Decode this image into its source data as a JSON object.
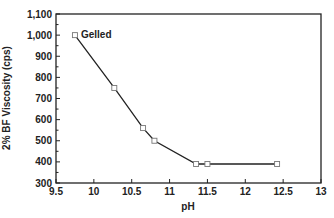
{
  "chart_data": {
    "type": "line",
    "title": "",
    "xlabel": "pH",
    "ylabel": "2% BF Viscosity (cps)",
    "xlim": [
      9.5,
      13
    ],
    "ylim": [
      300,
      1100
    ],
    "xticks": [
      9.5,
      10,
      10.5,
      11,
      11.5,
      12,
      12.5,
      13
    ],
    "xtick_labels": [
      "9.5",
      "10",
      "10.5",
      "11",
      "11.5",
      "12",
      "12.5",
      "13"
    ],
    "yticks": [
      300,
      400,
      500,
      600,
      700,
      800,
      900,
      1000,
      1100
    ],
    "ytick_labels": [
      "300",
      "400",
      "500",
      "600",
      "700",
      "800",
      "900",
      "1,000",
      "1,100"
    ],
    "grid": false,
    "series": [
      {
        "name": "Viscosity",
        "marker": "square",
        "x": [
          9.75,
          10.27,
          10.65,
          10.8,
          11.35,
          11.5,
          12.42
        ],
        "y": [
          1000,
          750,
          560,
          500,
          390,
          390,
          390
        ]
      }
    ],
    "annotations": [
      {
        "text": "Gelled",
        "x": 9.75,
        "y": 1000
      }
    ]
  },
  "colors": {
    "line": "#222222",
    "marker": "#777777",
    "axis": "#222222"
  }
}
